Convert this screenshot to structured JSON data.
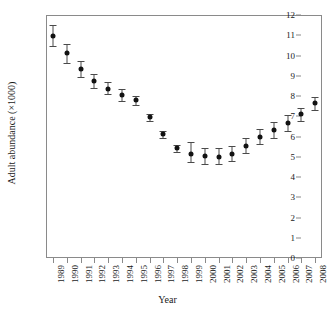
{
  "chart_data": {
    "type": "scatter",
    "title": "",
    "xlabel": "Year",
    "ylabel": "Adult abundance (×1000)",
    "categories": [
      "1989",
      "1990",
      "1991",
      "1992",
      "1993",
      "1994",
      "1995",
      "1996",
      "1997",
      "1998",
      "1999",
      "2000",
      "2001",
      "2002",
      "2003",
      "2004",
      "2005",
      "2006",
      "2007",
      "2008"
    ],
    "values": [
      10.95,
      10.1,
      9.33,
      8.75,
      8.37,
      8.05,
      7.8,
      6.95,
      6.1,
      5.42,
      5.15,
      5.03,
      5.0,
      5.15,
      5.52,
      6.0,
      6.3,
      6.67,
      7.1,
      7.63
    ],
    "error_low": [
      10.45,
      9.65,
      8.95,
      8.4,
      8.08,
      7.75,
      7.58,
      6.78,
      5.93,
      5.25,
      4.72,
      4.65,
      4.62,
      4.8,
      5.18,
      5.65,
      5.95,
      6.28,
      6.78,
      7.33
    ],
    "error_high": [
      11.5,
      10.58,
      9.72,
      9.08,
      8.68,
      8.35,
      8.02,
      7.12,
      6.28,
      5.6,
      5.72,
      5.45,
      5.42,
      5.52,
      5.92,
      6.35,
      6.7,
      7.05,
      7.43,
      7.95
    ],
    "ylim": [
      0,
      12
    ],
    "yticks": [
      0,
      1,
      2,
      3,
      4,
      5,
      6,
      7,
      8,
      9,
      10,
      11,
      12
    ],
    "ytick_labels": [
      "0",
      "1",
      "2",
      "3",
      "4",
      "5",
      "6",
      "7",
      "8",
      "9",
      "10",
      "11",
      "12"
    ],
    "grid": false,
    "legend": "none",
    "marker": "filled-circle",
    "errorbars": true
  }
}
